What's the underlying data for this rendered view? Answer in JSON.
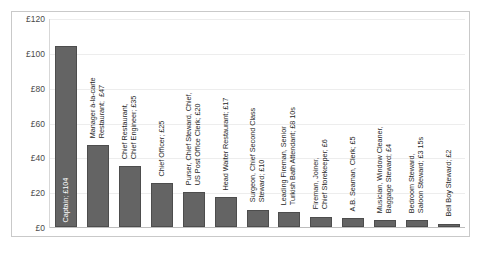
{
  "chart_data": {
    "type": "bar",
    "title": "",
    "subtitle": "",
    "xlabel": "",
    "ylabel": "",
    "ylim": [
      0,
      120
    ],
    "ytick_labels": [
      "£0",
      "£20",
      "£40",
      "£60",
      "£80",
      "£100",
      "£120"
    ],
    "ytick_values": [
      0,
      20,
      40,
      60,
      80,
      100,
      120
    ],
    "grid": true,
    "legend": "none",
    "currency_prefix": "£",
    "bar_color": "#646464",
    "bar_border_color": "#4d4d4d",
    "categories": [
      "Captain",
      "Manager à-la-carte Restaurant",
      "Chief Restaurant, Chief Engineer",
      "Chief Officer",
      "Purser, Chief Steward, Chief, US Post Office Clerk",
      "Head Waiter Restaurant",
      "Surgeon, Chief Second Class Steward",
      "Leading Fireman, Senior Turkish Bath Attendant",
      "Fireman, Joiner, Chief Storekeeper",
      "A.B. Seaman, Clerk",
      "Musician, Window Cleaner, Baggage Steward",
      "Bedroom Steward, Saloon Steward",
      "Bell Boy Steward"
    ],
    "values": [
      104,
      47,
      35,
      25,
      20,
      17,
      10,
      8.5,
      6,
      5,
      4,
      3.75,
      2
    ],
    "data_labels": [
      "Captain; £104",
      "Manager à-la-carte Restaurant;  £47",
      "Chief Restaurant, Chief Engineer; £35",
      "Chief Officer; £25",
      "Purser, Chief Steward, Chief, US Post Office Clerk; £20",
      "Head Waiter Restaurant; £17",
      "Surgeon, Chief Second Class Steward; £10",
      "Leading Fireman, Senior Turkish Bath Attendant; £8 10s",
      "Fireman, Joiner, Chief Storekeeper; £6",
      "A.B. Seaman, Clerk; £5",
      "Musician, Window Cleaner, Baggage Steward; £4",
      "Bedroom Steward, Saloon Steward; £3 15s",
      "Bell Boy Steward; £2"
    ],
    "label_lines": [
      [
        "Captain; £104"
      ],
      [
        "Manager à-la-carte",
        "Restaurant;  £47"
      ],
      [
        "Chief Restaurant,",
        "Chief Engineer; £35"
      ],
      [
        "Chief Officer; £25"
      ],
      [
        "Purser, Chief Steward, Chief,",
        "US Post Office Clerk; £20"
      ],
      [
        "Head Waiter Restaurant; £17"
      ],
      [
        "Surgeon, Chief Second Class",
        "Steward; £10"
      ],
      [
        "Leading Fireman, Senior",
        "Turkish Bath Attendant; £8 10s"
      ],
      [
        "Fireman, Joiner,",
        "Chief Storekeeper; £6"
      ],
      [
        "A.B. Seaman, Clerk; £5"
      ],
      [
        "Musician, Window Cleaner,",
        "Baggage Steward; £4"
      ],
      [
        "Bedroom Steward,",
        "Saloon Steward; £3 15s"
      ],
      [
        "Bell Boy Steward; £2"
      ]
    ]
  }
}
